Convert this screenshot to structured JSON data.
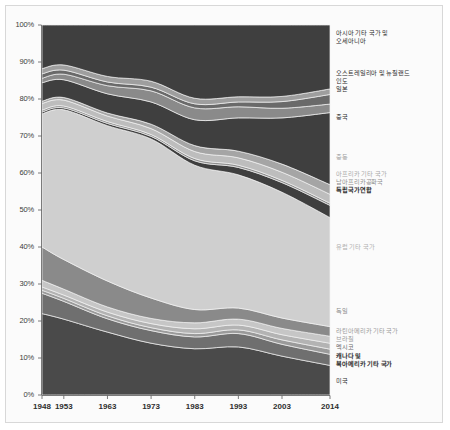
{
  "figure": {
    "background": "#fbfbfb",
    "border_color": "#d8d8d8",
    "plot_area": {
      "x": 42,
      "y": 25,
      "width": 288,
      "height": 370
    }
  },
  "chart_data": {
    "type": "area",
    "stacked": "percent",
    "title": "",
    "xlabel": "",
    "ylabel": "",
    "grid": false,
    "legend_position": "right",
    "x": [
      1948,
      1953,
      1963,
      1973,
      1983,
      1993,
      2003,
      2014
    ],
    "xtick_labels": [
      "1948",
      "1953",
      "1963",
      "1973",
      "1983",
      "1993",
      "2003",
      "2014"
    ],
    "ytick_labels": [
      "0%",
      "10%",
      "20%",
      "30%",
      "40%",
      "50%",
      "60%",
      "70%",
      "80%",
      "90%",
      "100%"
    ],
    "ylim": [
      0,
      100
    ],
    "series": [
      {
        "name": "미국",
        "color": "#4a4a4a",
        "label_color": "#3a3a3a",
        "label_weight": "normal",
        "values": [
          22.0,
          20.5,
          17.0,
          14.0,
          12.5,
          13.0,
          10.5,
          8.0
        ]
      },
      {
        "name": "캐나다 및\n북아메리카 기타 국가",
        "color": "#6f6f6f",
        "label_color": "#3a3a3a",
        "label_weight": "bold",
        "values": [
          5.5,
          4.8,
          3.6,
          3.4,
          3.2,
          3.6,
          3.2,
          3.0
        ]
      },
      {
        "name": "멕시코",
        "color": "#9a9a9a",
        "label_color": "#6a6a6a",
        "label_weight": "normal",
        "values": [
          0.8,
          0.8,
          0.8,
          0.8,
          0.9,
          1.0,
          1.2,
          1.4
        ]
      },
      {
        "name": "브라질",
        "color": "#b3b3b3",
        "label_color": "#9a9a9a",
        "label_weight": "normal",
        "values": [
          0.9,
          0.9,
          1.0,
          1.1,
          1.3,
          1.3,
          1.4,
          1.6
        ]
      },
      {
        "name": "라틴아메리카 기타 국가",
        "color": "#c6c6c6",
        "label_color": "#9a9a9a",
        "label_weight": "normal",
        "values": [
          1.8,
          1.6,
          1.4,
          1.4,
          1.6,
          1.6,
          1.7,
          1.9
        ]
      },
      {
        "name": "독일",
        "color": "#8a8a8a",
        "label_color": "#8a8a8a",
        "label_weight": "normal",
        "values": [
          9.0,
          8.0,
          7.0,
          5.5,
          3.6,
          3.0,
          2.8,
          2.6
        ]
      },
      {
        "name": "유럽 기타 국가",
        "color": "#cfcfcf",
        "label_color": "#b0b0b0",
        "label_weight": "normal",
        "values": [
          36.0,
          40.5,
          42.0,
          43.0,
          39.0,
          36.0,
          34.0,
          29.5
        ]
      },
      {
        "name": "독립국가연합",
        "color": "#3f3f3f",
        "label_color": "#2a2a2a",
        "label_weight": "bold",
        "values": [
          0.5,
          0.5,
          0.6,
          0.7,
          1.2,
          2.0,
          2.6,
          3.3
        ]
      },
      {
        "name": "남아프리카공화국",
        "color": "#8f8f8f",
        "label_color": "#8f8f8f",
        "label_weight": "normal",
        "values": [
          0.5,
          0.5,
          0.5,
          0.5,
          0.6,
          0.6,
          0.6,
          0.6
        ]
      },
      {
        "name": "아프리카 기타 국가",
        "color": "#bdbdbd",
        "label_color": "#a8a8a8",
        "label_weight": "normal",
        "values": [
          1.8,
          1.6,
          1.5,
          1.6,
          1.9,
          2.0,
          2.2,
          2.4
        ]
      },
      {
        "name": "중동",
        "color": "#a5a5a5",
        "label_color": "#a0a0a0",
        "label_weight": "normal",
        "values": [
          0.6,
          0.7,
          0.8,
          1.2,
          1.6,
          1.8,
          2.2,
          2.6
        ]
      },
      {
        "name": "중국",
        "color": "#3f3f3f",
        "label_color": "#2a2a2a",
        "label_weight": "normal",
        "values": [
          5.0,
          4.8,
          5.2,
          6.0,
          7.0,
          9.0,
          12.5,
          19.5
        ]
      },
      {
        "name": "일본",
        "color": "#8a8a8a",
        "label_color": "#2a2a2a",
        "label_weight": "normal",
        "values": [
          1.2,
          1.5,
          2.2,
          3.0,
          3.2,
          3.0,
          2.6,
          2.3
        ]
      },
      {
        "name": "인도",
        "color": "#6a6a6a",
        "label_color": "#2a2a2a",
        "label_weight": "normal",
        "values": [
          1.2,
          1.1,
          1.0,
          1.0,
          1.1,
          1.3,
          1.8,
          2.6
        ]
      },
      {
        "name": "오스트레일리아 및 뉴질랜드",
        "color": "#9e9e9e",
        "label_color": "#2a2a2a",
        "label_weight": "normal",
        "values": [
          1.4,
          1.4,
          1.5,
          1.6,
          1.5,
          1.4,
          1.4,
          1.5
        ]
      },
      {
        "name": "아시아 기타 국가 및\n오세아니아",
        "color": "#3f3f3f",
        "label_color": "#2a2a2a",
        "label_weight": "normal",
        "values": [
          11.8,
          10.8,
          13.9,
          15.2,
          19.8,
          19.4,
          19.3,
          17.3
        ]
      }
    ]
  },
  "legend": [
    {
      "id": "asia-other-oceania",
      "lines": [
        "아시아 기타 국가 및",
        "오세아니아"
      ],
      "y": 29,
      "color": "#2a2a2a",
      "weight": "normal"
    },
    {
      "id": "australia-newzealand",
      "lines": [
        "오스트레일리아 및 뉴질랜드"
      ],
      "y": 69,
      "color": "#2a2a2a",
      "weight": "normal"
    },
    {
      "id": "india",
      "lines": [
        "인도"
      ],
      "y": 77,
      "color": "#2a2a2a",
      "weight": "normal"
    },
    {
      "id": "japan",
      "lines": [
        "일본"
      ],
      "y": 85,
      "color": "#2a2a2a",
      "weight": "normal"
    },
    {
      "id": "china",
      "lines": [
        "중국"
      ],
      "y": 113,
      "color": "#2a2a2a",
      "weight": "normal"
    },
    {
      "id": "middle-east",
      "lines": [
        "중동"
      ],
      "y": 153,
      "color": "#a0a0a0",
      "weight": "normal"
    },
    {
      "id": "africa-other",
      "lines": [
        "아프리카 기타 국가"
      ],
      "y": 170,
      "color": "#a8a8a8",
      "weight": "normal"
    },
    {
      "id": "south-africa",
      "lines": [
        "남아프리카공화국"
      ],
      "y": 178,
      "color": "#8f8f8f",
      "weight": "normal"
    },
    {
      "id": "cis",
      "lines": [
        "독립국가연합"
      ],
      "y": 186,
      "color": "#2a2a2a",
      "weight": "bold"
    },
    {
      "id": "europe-other",
      "lines": [
        "유럽 기타 국가"
      ],
      "y": 243,
      "color": "#b0b0b0",
      "weight": "normal"
    },
    {
      "id": "germany",
      "lines": [
        "독일"
      ],
      "y": 307,
      "color": "#8a8a8a",
      "weight": "normal"
    },
    {
      "id": "latin-america-other",
      "lines": [
        "라틴아메리카 기타 국가"
      ],
      "y": 327,
      "color": "#9a9a9a",
      "weight": "normal"
    },
    {
      "id": "brazil",
      "lines": [
        "브라질"
      ],
      "y": 335,
      "color": "#9a9a9a",
      "weight": "normal"
    },
    {
      "id": "mexico",
      "lines": [
        "멕시코"
      ],
      "y": 343,
      "color": "#6a6a6a",
      "weight": "normal"
    },
    {
      "id": "canada-north-america-other",
      "lines": [
        "캐나다 및",
        "북아메리카 기타 국가"
      ],
      "y": 352,
      "color": "#2a2a2a",
      "weight": "bold"
    },
    {
      "id": "usa",
      "lines": [
        "미국"
      ],
      "y": 377,
      "color": "#2a2a2a",
      "weight": "normal"
    }
  ]
}
